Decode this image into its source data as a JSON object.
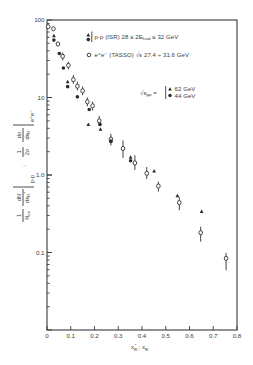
{
  "chart_data": {
    "type": "scatter",
    "title": "",
    "xlabel": "x_R* ; x_R",
    "ylabel": "1/N_ev dN/dx_R* |p-p ; 1/2σ dσ/dx_R |e+e-",
    "xlim": [
      0,
      0.8
    ],
    "ylim": [
      0.01,
      100
    ],
    "yscale": "log",
    "grid": false,
    "legend_position": "upper right (inside plot)",
    "xticks": [
      {
        "value": 0,
        "label": "0"
      },
      {
        "value": 0.1,
        "label": "0.1"
      },
      {
        "value": 0.2,
        "label": "0.2"
      },
      {
        "value": 0.3,
        "label": "0.3"
      },
      {
        "value": 0.4,
        "label": "0.4"
      },
      {
        "value": 0.5,
        "label": "0.5"
      },
      {
        "value": 0.6,
        "label": "0.6"
      },
      {
        "value": 0.7,
        "label": "0.7"
      },
      {
        "value": 0.8,
        "label": "0.8"
      }
    ],
    "yticks": [
      {
        "value": 0.1,
        "label": "0.1"
      },
      {
        "value": 1,
        "label": "1.0"
      },
      {
        "value": 10,
        "label": "10"
      },
      {
        "value": 100,
        "label": "100"
      }
    ],
    "series": [
      {
        "name": "e+e- (TASSO) √s 27.4 ÷ 31.6 GeV",
        "marker": "circle-open",
        "points": [
          {
            "x": 0.005,
            "y": 82
          },
          {
            "x": 0.027,
            "y": 77
          },
          {
            "x": 0.046,
            "y": 49
          },
          {
            "x": 0.066,
            "y": 34,
            "err": [
              30,
              38
            ]
          },
          {
            "x": 0.09,
            "y": 26,
            "err": [
              23,
              29
            ]
          },
          {
            "x": 0.111,
            "y": 17,
            "err": [
              15,
              19.5
            ]
          },
          {
            "x": 0.128,
            "y": 14,
            "err": [
              12.3,
              16
            ]
          },
          {
            "x": 0.15,
            "y": 12.2,
            "err": [
              10.7,
              13.9
            ]
          },
          {
            "x": 0.17,
            "y": 8.8,
            "err": [
              7.7,
              10
            ]
          },
          {
            "x": 0.192,
            "y": 7.8,
            "err": [
              6.8,
              8.9
            ]
          },
          {
            "x": 0.22,
            "y": 5.0,
            "err": [
              4.3,
              5.8
            ]
          },
          {
            "x": 0.269,
            "y": 2.9,
            "err": [
              2.4,
              3.4
            ]
          },
          {
            "x": 0.32,
            "y": 2.2,
            "err": [
              1.66,
              2.8
            ]
          },
          {
            "x": 0.37,
            "y": 1.43,
            "err": [
              1.16,
              1.8
            ]
          },
          {
            "x": 0.42,
            "y": 1.05,
            "err": [
              0.89,
              1.27
            ]
          },
          {
            "x": 0.469,
            "y": 0.72,
            "err": [
              0.61,
              0.82
            ]
          },
          {
            "x": 0.557,
            "y": 0.44,
            "err": [
              0.35,
              0.52
            ]
          },
          {
            "x": 0.647,
            "y": 0.18,
            "err": [
              0.138,
              0.215
            ]
          },
          {
            "x": 0.754,
            "y": 0.084,
            "err": [
              0.059,
              0.099
            ]
          }
        ]
      },
      {
        "name": "p-p (ISR) √s_pp = 62 GeV",
        "marker": "triangle",
        "points": [
          {
            "x": 0.029,
            "y": 63
          },
          {
            "x": 0.087,
            "y": 16
          },
          {
            "x": 0.174,
            "y": 4.5
          },
          {
            "x": 0.225,
            "y": 3.9
          },
          {
            "x": 0.269,
            "y": 2.8
          },
          {
            "x": 0.352,
            "y": 1.7
          },
          {
            "x": 0.451,
            "y": 1.13
          },
          {
            "x": 0.549,
            "y": 0.54
          },
          {
            "x": 0.651,
            "y": 0.34
          }
        ]
      },
      {
        "name": "p-p (ISR) √s_pp = 44 GeV",
        "marker": "circle-filled",
        "points": [
          {
            "x": 0.029,
            "y": 55
          },
          {
            "x": 0.052,
            "y": 37
          },
          {
            "x": 0.069,
            "y": 24
          },
          {
            "x": 0.087,
            "y": 13.8
          },
          {
            "x": 0.128,
            "y": 10.2
          },
          {
            "x": 0.178,
            "y": 7.0
          },
          {
            "x": 0.223,
            "y": 4.5
          },
          {
            "x": 0.269,
            "y": 2.7
          },
          {
            "x": 0.352,
            "y": 1.53
          }
        ]
      }
    ],
    "legend": {
      "pp_main": "p-p (ISR) 28 ≤ 2E",
      "pp_sub": "had",
      "pp_tail": " ≤ 32 GeV",
      "ee_main": "e⁺e⁻ (TASSO)  √s 27.4 ÷ 31.6 GeV",
      "sqrt_s": "√s",
      "sqrt_s_sub": "pp",
      "equals": " =",
      "energy_62": "62 GeV",
      "energy_44": "44 GeV"
    },
    "xlabel_parts": {
      "x1": "x",
      "x1_sub": "R",
      "x1_sup": "*",
      "sep": " ; ",
      "x2": "x",
      "x2_sub": "R"
    },
    "ylabel_parts": {
      "n1_num": "1",
      "n1_den": "N",
      "n1_den_sub": "ev",
      "n2_num": "dN",
      "n2_den": "dx",
      "n2_den_sub": "R",
      "n2_den_sup": "*",
      "pp": "p-p",
      "sep": ";",
      "e1_num": "1",
      "e1_den": "2σ",
      "e2_num": "dσ",
      "e2_den": "dx",
      "e2_den_sub": "R",
      "ee": "e⁺e⁻"
    }
  }
}
